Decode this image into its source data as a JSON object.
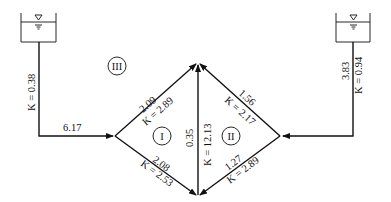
{
  "diagram": {
    "type": "pipe-network",
    "reservoirs": [
      {
        "id": "left-reservoir",
        "symbol": "water-surface"
      },
      {
        "id": "right-reservoir",
        "symbol": "water-surface"
      }
    ],
    "loops": {
      "I": "I",
      "II": "II",
      "III": "III"
    },
    "pipes": {
      "left_supply": {
        "k": "K = 0.38",
        "flow": "6.17"
      },
      "right_supply": {
        "k": "K = 0.94",
        "flow": "3.83"
      },
      "upper_left": {
        "k": "K = 2.89",
        "flow": "2.09"
      },
      "lower_left": {
        "k": "K = 2.53",
        "flow": "2.08"
      },
      "middle": {
        "k": "K = 12.13",
        "flow": "0.35"
      },
      "upper_right": {
        "k": "K = 2.17",
        "flow": "1.56"
      },
      "lower_right": {
        "k": "K = 2.89",
        "flow": "1.27"
      }
    }
  }
}
